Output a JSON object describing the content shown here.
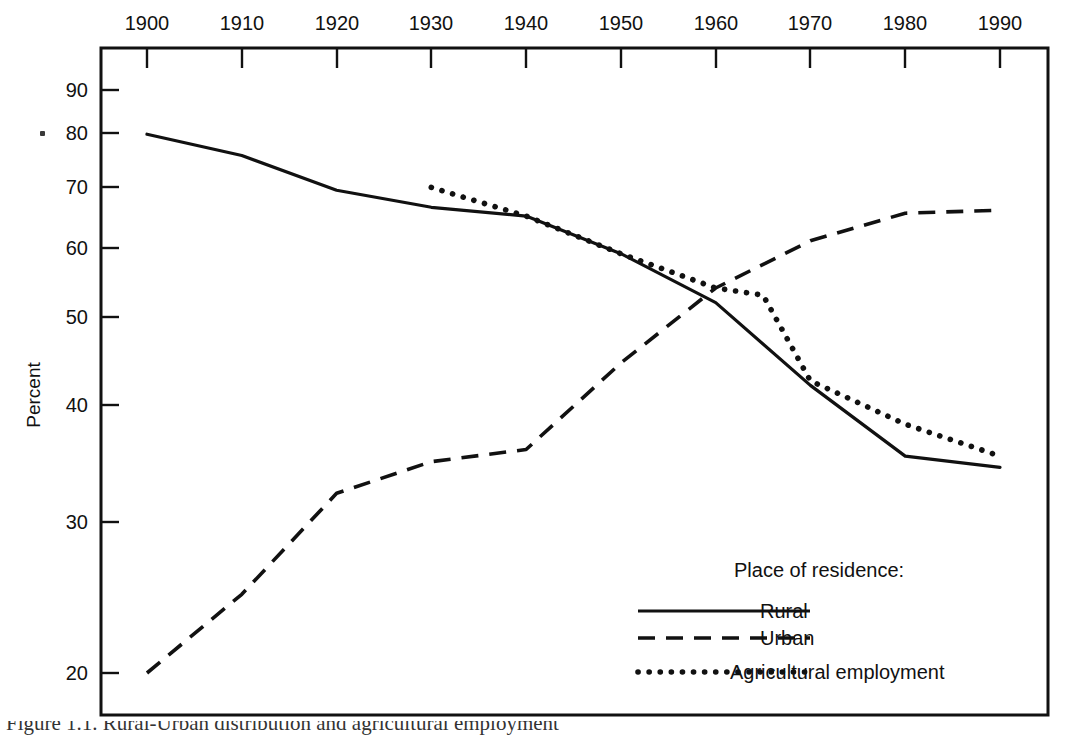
{
  "chart_data": {
    "type": "line",
    "title": "",
    "xlabel": "",
    "ylabel": "Percent",
    "x_ticks": [
      1900,
      1910,
      1920,
      1930,
      1940,
      1950,
      1960,
      1970,
      1980,
      1990
    ],
    "x_tick_labels": [
      "1900",
      "1910",
      "1920",
      "1930",
      "1940",
      "1950",
      "1960",
      "1970",
      "1980",
      "1990"
    ],
    "xlim": [
      1900,
      1990
    ],
    "x_axis_position": "top",
    "y_ticks": [
      20,
      30,
      40,
      50,
      60,
      70,
      80,
      90
    ],
    "y_tick_labels": [
      "20",
      "30",
      "40",
      "50",
      "60",
      "70",
      "80",
      "90"
    ],
    "ylim": [
      17,
      96
    ],
    "y_scale": "log",
    "grid": false,
    "legend_position": "inside-bottom-right",
    "legend_title": "Place of residence:",
    "series": [
      {
        "name": "Rural",
        "style": "solid",
        "x": [
          1900,
          1910,
          1920,
          1930,
          1940,
          1950,
          1960,
          1970,
          1980,
          1990
        ],
        "values": [
          80.3,
          76.0,
          69.5,
          66.5,
          65.0,
          59.0,
          52.0,
          42.0,
          35.0,
          34.0
        ]
      },
      {
        "name": "Urban",
        "style": "dashed",
        "x": [
          1900,
          1910,
          1920,
          1930,
          1940,
          1950,
          1960,
          1970,
          1980,
          1990
        ],
        "values": [
          20.0,
          24.5,
          31.8,
          34.5,
          35.6,
          44.5,
          54.0,
          61.0,
          65.5,
          66.0
        ]
      },
      {
        "name": "Agricultural employment",
        "style": "dotted",
        "x": [
          1930,
          1940,
          1950,
          1960,
          1965,
          1970,
          1980,
          1990
        ],
        "values": [
          70.0,
          65.0,
          59.0,
          54.0,
          53.0,
          42.5,
          38.0,
          35.0
        ]
      }
    ],
    "annotations": []
  },
  "axes": {
    "y_title": "Percent"
  },
  "legend": {
    "title": "Place of residence:",
    "entries": [
      {
        "label": "Rural",
        "style": "solid"
      },
      {
        "label": "Urban",
        "style": "dashed"
      },
      {
        "label": "Agricultural employment",
        "style": "dotted"
      }
    ]
  },
  "caption": {
    "text": "Figure 1.1.  Rural-Urban distribution and agricultural employment"
  },
  "colors": {
    "ink": "#111111",
    "background": "#ffffff"
  }
}
